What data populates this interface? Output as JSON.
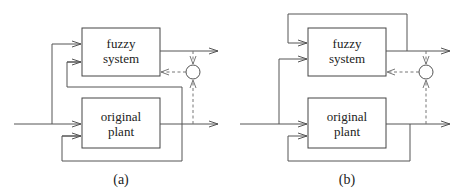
{
  "diagrams": [
    {
      "id": "a",
      "caption": "(a)",
      "blocks": {
        "fuzzy": {
          "line1": "fuzzy",
          "line2": "system"
        },
        "plant": {
          "line1": "original",
          "line2": "plant"
        }
      }
    },
    {
      "id": "b",
      "caption": "(b)",
      "blocks": {
        "fuzzy": {
          "line1": "fuzzy",
          "line2": "system"
        },
        "plant": {
          "line1": "original",
          "line2": "plant"
        }
      }
    }
  ],
  "colors": {
    "line": "#555555",
    "dashed": "#777777",
    "text": "#222222",
    "background": "#ffffff"
  }
}
